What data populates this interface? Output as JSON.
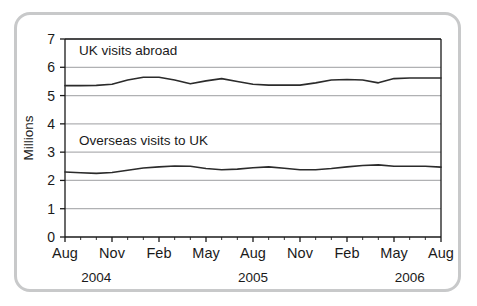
{
  "chart_data": {
    "type": "line",
    "title": "",
    "xlabel": "",
    "ylabel": "Millions",
    "ylim": [
      0,
      7
    ],
    "ytick_step": 1,
    "yticks": [
      "0",
      "1",
      "2",
      "3",
      "4",
      "5",
      "6",
      "7"
    ],
    "grid": "horizontal",
    "legend": "inline-labels",
    "x": [
      "Aug 2004",
      "Sep 2004",
      "Oct 2004",
      "Nov 2004",
      "Dec 2004",
      "Jan 2005",
      "Feb 2005",
      "Mar 2005",
      "Apr 2005",
      "May 2005",
      "Jun 2005",
      "Jul 2005",
      "Aug 2005",
      "Sep 2005",
      "Oct 2005",
      "Nov 2005",
      "Dec 2005",
      "Jan 2006",
      "Feb 2006",
      "Mar 2006",
      "Apr 2006",
      "May 2006",
      "Jun 2006",
      "Jul 2006",
      "Aug 2006"
    ],
    "xtick_labels": [
      "Aug",
      "Nov",
      "Feb",
      "May",
      "Aug",
      "Nov",
      "Feb",
      "May",
      "Aug"
    ],
    "xtick_indices": [
      0,
      3,
      6,
      9,
      12,
      15,
      18,
      21,
      24
    ],
    "year_labels": [
      "2004",
      "2005",
      "2006"
    ],
    "year_tick_indices": [
      2,
      12,
      22
    ],
    "series": [
      {
        "name": "UK visits abroad",
        "label_value_y": 6.45,
        "color": "#2b2b2b",
        "values": [
          5.35,
          5.35,
          5.36,
          5.4,
          5.55,
          5.65,
          5.65,
          5.55,
          5.42,
          5.52,
          5.6,
          5.5,
          5.4,
          5.37,
          5.37,
          5.37,
          5.45,
          5.55,
          5.57,
          5.55,
          5.45,
          5.6,
          5.62,
          5.62,
          5.62
        ]
      },
      {
        "name": "Overseas visits to UK",
        "label_value_y": 3.25,
        "color": "#2b2b2b",
        "values": [
          2.3,
          2.27,
          2.25,
          2.28,
          2.36,
          2.44,
          2.48,
          2.51,
          2.5,
          2.42,
          2.38,
          2.4,
          2.45,
          2.48,
          2.43,
          2.38,
          2.38,
          2.42,
          2.48,
          2.53,
          2.55,
          2.5,
          2.5,
          2.5,
          2.47
        ]
      }
    ],
    "colors": {
      "line": "#2b2b2b",
      "gridline": "#b0b1b3",
      "axis": "#1a1a1a",
      "frame_border": "#c8c9ca",
      "background": "#ffffff"
    }
  }
}
